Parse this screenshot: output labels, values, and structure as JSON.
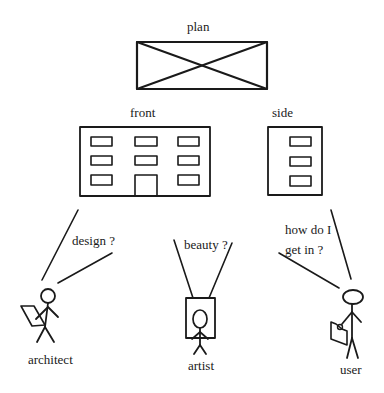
{
  "diagram": {
    "views": {
      "plan": {
        "label": "plan"
      },
      "front": {
        "label": "front"
      },
      "side": {
        "label": "side"
      }
    },
    "actors": [
      {
        "id": "architect",
        "label": "architect",
        "question": [
          "design ?"
        ]
      },
      {
        "id": "artist",
        "label": "artist",
        "question": [
          "beauty ?"
        ]
      },
      {
        "id": "user",
        "label": "user",
        "question": [
          "how do I",
          "get in ?"
        ]
      }
    ],
    "colors": {
      "ink": "#1a1a1a",
      "background": "#ffffff"
    }
  }
}
